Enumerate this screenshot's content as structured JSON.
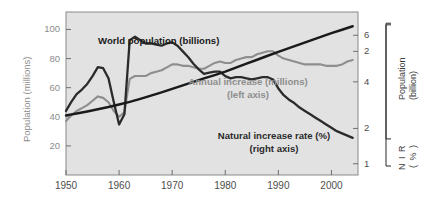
{
  "chart_data": {
    "type": "line",
    "title": "",
    "subtitle": "",
    "xlabel": "",
    "ylabel": "Population (millions)",
    "grid": false,
    "legend": "inline-annotations",
    "xlim": [
      1950,
      2005
    ],
    "x_ticks": [
      "1950",
      "1960",
      "1970",
      "1980",
      "1990",
      "2000"
    ],
    "x_tick_values": [
      1950,
      1960,
      1970,
      1980,
      1990,
      2000
    ],
    "left_axis": {
      "label": "Population (millions)",
      "ticks": [
        "100",
        "80",
        "60",
        "40",
        "20"
      ],
      "tick_values": [
        100,
        80,
        60,
        40,
        20
      ],
      "ylim": [
        0,
        112
      ],
      "color": "#8c8c8c"
    },
    "right_axis_upper": {
      "label_line1": "Population",
      "label_line2": "(billion)",
      "ticks": [
        "6",
        "4",
        "2"
      ],
      "tick_values": [
        6,
        4,
        2
      ],
      "ylim": [
        0,
        7
      ],
      "color": "#3a3a3a"
    },
    "right_axis_lower": {
      "label_line1": "N I R",
      "label_line2": "( % )",
      "ticks": [
        "2",
        "1"
      ],
      "tick_values": [
        2,
        1
      ],
      "ylim": [
        0.9,
        2.35
      ],
      "color": "#3a3a3a"
    },
    "annotations": [
      {
        "name": "world-population",
        "text": "World population (billions)",
        "color": "#1a1a1a"
      },
      {
        "name": "annual-increase",
        "line1": "Annual increase (millions)",
        "line2": "(left axis)",
        "color": "#8e8e8e"
      },
      {
        "name": "natural-increase-rate",
        "line1": "Natural increase rate (%)",
        "line2": "(right axis)",
        "color": "#2b2b2b"
      }
    ],
    "series": [
      {
        "name": "World population (billions)",
        "axis": "right_upper",
        "unit": "billions",
        "color": "#1a1a1a",
        "x": [
          1950,
          1952,
          1954,
          1956,
          1958,
          1960,
          1962,
          1964,
          1966,
          1968,
          1970,
          1972,
          1974,
          1976,
          1978,
          1980,
          1982,
          1984,
          1986,
          1988,
          1990,
          1992,
          1994,
          1996,
          1998,
          2000,
          2002,
          2004
        ],
        "values": [
          2.56,
          2.64,
          2.73,
          2.82,
          2.92,
          3.03,
          3.14,
          3.27,
          3.41,
          3.55,
          3.7,
          3.85,
          4.0,
          4.15,
          4.29,
          4.44,
          4.61,
          4.78,
          4.95,
          5.12,
          5.29,
          5.45,
          5.61,
          5.77,
          5.93,
          6.09,
          6.24,
          6.39
        ]
      },
      {
        "name": "Annual increase (millions)",
        "axis": "left",
        "unit": "millions",
        "color": "#8e8e8e",
        "x": [
          1950,
          1951,
          1952,
          1953,
          1954,
          1955,
          1956,
          1957,
          1958,
          1959,
          1960,
          1961,
          1962,
          1963,
          1964,
          1965,
          1966,
          1967,
          1968,
          1969,
          1970,
          1971,
          1972,
          1973,
          1974,
          1975,
          1976,
          1977,
          1978,
          1979,
          1980,
          1981,
          1982,
          1983,
          1984,
          1985,
          1986,
          1987,
          1988,
          1989,
          1990,
          1991,
          1992,
          1993,
          1994,
          1995,
          1996,
          1997,
          1998,
          1999,
          2000,
          2001,
          2002,
          2003,
          2004
        ],
        "values": [
          37,
          41,
          44,
          46,
          48,
          51,
          54,
          53,
          50,
          44,
          40,
          43,
          66,
          68,
          68,
          68,
          70,
          71,
          72,
          74,
          76,
          76,
          75,
          75,
          74,
          73,
          73,
          75,
          77,
          78,
          77,
          77,
          79,
          80,
          81,
          81,
          83,
          84,
          85,
          85,
          82,
          80,
          79,
          78,
          77,
          76,
          76,
          76,
          76,
          75,
          75,
          75,
          76,
          78,
          79
        ]
      },
      {
        "name": "Natural increase rate (%)",
        "axis": "right_lower",
        "unit": "percent",
        "color": "#2b2b2b",
        "x": [
          1950,
          1951,
          1952,
          1953,
          1954,
          1955,
          1956,
          1957,
          1958,
          1959,
          1960,
          1961,
          1962,
          1963,
          1964,
          1965,
          1966,
          1967,
          1968,
          1969,
          1970,
          1971,
          1972,
          1973,
          1974,
          1975,
          1976,
          1977,
          1978,
          1979,
          1980,
          1981,
          1982,
          1983,
          1984,
          1985,
          1986,
          1987,
          1988,
          1989,
          1990,
          1991,
          1992,
          1993,
          1994,
          1995,
          1996,
          1997,
          1998,
          1999,
          2000,
          2001,
          2002,
          2003,
          2004
        ],
        "values": [
          1.47,
          1.55,
          1.62,
          1.66,
          1.71,
          1.78,
          1.86,
          1.85,
          1.76,
          1.55,
          1.35,
          1.44,
          2.1,
          2.13,
          2.1,
          2.07,
          2.07,
          2.06,
          2.05,
          2.07,
          2.08,
          2.05,
          2.0,
          1.95,
          1.89,
          1.84,
          1.8,
          1.81,
          1.82,
          1.82,
          1.78,
          1.76,
          1.77,
          1.77,
          1.76,
          1.75,
          1.76,
          1.77,
          1.77,
          1.75,
          1.67,
          1.61,
          1.57,
          1.54,
          1.5,
          1.47,
          1.44,
          1.41,
          1.38,
          1.35,
          1.32,
          1.29,
          1.27,
          1.25,
          1.23
        ]
      }
    ]
  },
  "plot": {
    "left": 66,
    "top": 12,
    "right": 358,
    "bottom": 175,
    "background": "#e2e2e2",
    "border": "#8a8a8a"
  }
}
